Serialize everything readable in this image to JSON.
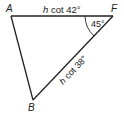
{
  "diagram": {
    "type": "triangle",
    "vertices": {
      "A": {
        "label": "A"
      },
      "F": {
        "label": "F"
      },
      "B": {
        "label": "B"
      }
    },
    "edges": {
      "AF": {
        "label_var": "h",
        "label_rest": " cot 42°"
      },
      "FB": {
        "label_var": "h",
        "label_rest": " cot 38°"
      },
      "AB": {
        "label_var": "",
        "label_rest": ""
      }
    },
    "angles": {
      "F": {
        "label": "45°"
      }
    },
    "colors": {
      "stroke": "#222222",
      "background": "#ffffff"
    }
  }
}
